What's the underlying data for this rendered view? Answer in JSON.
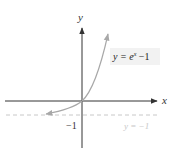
{
  "figure": {
    "axis_x_label": "x",
    "axis_y_label": "y",
    "curve_label": "y = eˣ − 1",
    "curve_label_base": "y = e",
    "curve_label_exp": "x",
    "curve_label_tail": " −1",
    "asymptote_label": "y = −1",
    "tick_label_neg1": "−1",
    "colors": {
      "axes": "#333333",
      "curve": "#a8a8a8",
      "asymptote": "#c8c8c8",
      "label_bg": "#f2f2f2"
    }
  }
}
